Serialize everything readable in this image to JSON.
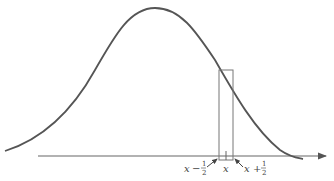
{
  "diagram": {
    "type": "normal-curve-continuity-correction",
    "colors": {
      "curve": "#555555",
      "axis": "#666666",
      "rect": "#777777",
      "text": "#444444"
    },
    "labels": {
      "left_var": "x",
      "left_op": "−",
      "left_num": "1",
      "left_den": "2",
      "center": "x",
      "right_var": "x",
      "right_op": "+",
      "right_num": "1",
      "right_den": "2"
    }
  }
}
